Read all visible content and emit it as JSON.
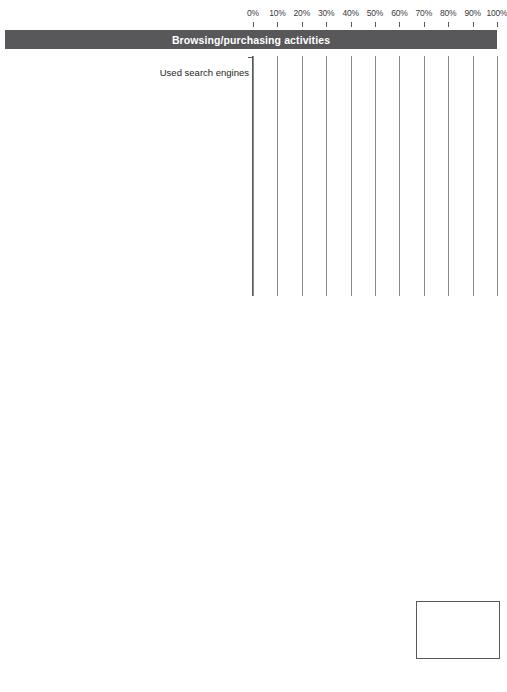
{
  "chart_data": {
    "type": "bar",
    "orientation": "horizontal",
    "title": "",
    "xlabel": "",
    "ylabel": "",
    "xlim": [
      0,
      100
    ],
    "grid": true,
    "legend_position": "bottom-right",
    "axis_ticks": [
      "0%",
      "10%",
      "20%",
      "30%",
      "40%",
      "50%",
      "60%",
      "70%",
      "80%",
      "90%",
      "100%"
    ],
    "axis_tick_values": [
      0,
      10,
      20,
      30,
      40,
      50,
      60,
      70,
      80,
      90,
      100
    ],
    "series_names": [
      "Urban",
      "Suburban",
      "Rural"
    ],
    "series_colors": [
      "#3f3f42",
      "#9b9b9e",
      "#2b2b2e"
    ],
    "sections": [
      {
        "header": "Browsing/purchasing activities",
        "categories": [
          "Used search engines",
          "Browsed for or purchased items online",
          "Used an online banking or investment Web site",
          "Browsed for or purchased books online",
          "Used an online question service",
          "Read someone's blog",
          "Searched for or borrowed items from the library Web site",
          "Read online (electronic) books"
        ],
        "series": [
          {
            "name": "Urban",
            "values": [
              83,
              72,
              56,
              55,
              41,
              47,
              23,
              20
            ]
          },
          {
            "name": "Suburban",
            "values": [
              86,
              75,
              57,
              57,
              43,
              47,
              25,
              18
            ]
          },
          {
            "name": "Rural",
            "values": [
              89,
              77,
              55,
              56,
              42,
              46,
              21,
              14
            ]
          }
        ]
      },
      {
        "header": "Interacting activities",
        "categories": [
          "Sent or received e-mails",
          "Sent or received instant messages",
          "Used a social networking site",
          "Used chat rooms",
          "Used online dating sites",
          "Accessed business-related social networking sites"
        ],
        "series": [
          {
            "name": "Urban",
            "values": [
              90,
              52,
              29,
              18,
              7,
              4
            ]
          },
          {
            "name": "Suburban",
            "values": [
              92,
              52,
              30,
              17,
              6,
              3
            ]
          },
          {
            "name": "Rural",
            "values": [
              94,
              52,
              23,
              18,
              5,
              2
            ]
          }
        ]
      },
      {
        "header": "Creating activities",
        "categories": [
          "Used a social media site",
          "Blogged or wrote an online diary/journal",
          "Created a Web page",
          "Contributed information to others' Web pages"
        ],
        "series": [
          {
            "name": "Urban",
            "values": [
              26,
              18,
              21,
              21
            ]
          },
          {
            "name": "Suburban",
            "values": [
              30,
              16,
              19,
              17
            ]
          },
          {
            "name": "Rural",
            "values": [
              24,
              15,
              16,
              16
            ]
          }
        ]
      }
    ]
  },
  "legend": {
    "items": [
      {
        "label": "Urban",
        "color": "#3f3f42",
        "key": "urban"
      },
      {
        "label": "Suburban",
        "color": "#9b9b9e",
        "key": "suburban"
      },
      {
        "label": "Rural",
        "color": "#2b2b2e",
        "key": "rural"
      }
    ]
  }
}
